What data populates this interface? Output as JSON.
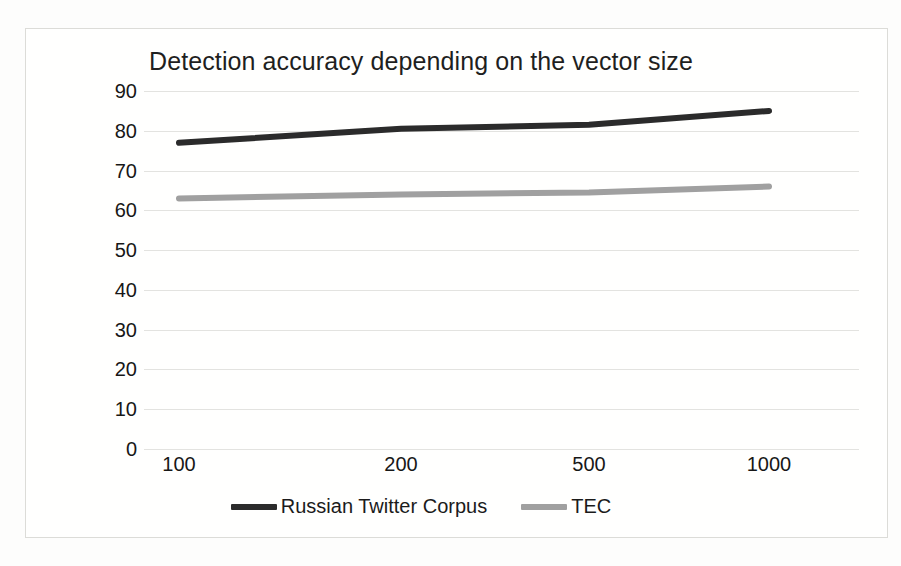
{
  "chart_data": {
    "type": "line",
    "title": "Detection accuracy depending on the vector size",
    "xlabel": "",
    "ylabel": "",
    "categories": [
      "100",
      "200",
      "500",
      "1000"
    ],
    "x": [
      100,
      200,
      500,
      1000
    ],
    "series": [
      {
        "name": "Russian Twitter Corpus",
        "values": [
          77,
          80.5,
          81.5,
          85
        ],
        "color": "#2b2b2b"
      },
      {
        "name": "TEC",
        "values": [
          63,
          64,
          64.5,
          66
        ],
        "color": "#a0a0a0"
      }
    ],
    "ylim": [
      0,
      90
    ],
    "yticks": [
      "90",
      "80",
      "70",
      "60",
      "50",
      "40",
      "30",
      "20",
      "10",
      "0"
    ],
    "ytick_values": [
      90,
      80,
      70,
      60,
      50,
      40,
      30,
      20,
      10,
      0
    ],
    "grid": true,
    "grid_color": "#e3e3e0",
    "legend_position": "bottom",
    "plot_background": "#ffffff",
    "frame_border_color": "#dcdcd8"
  }
}
